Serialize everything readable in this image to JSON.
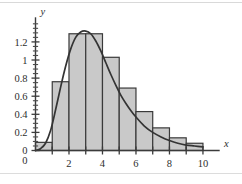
{
  "chart_data": {
    "type": "bar",
    "title": "",
    "subtitle": "",
    "xlabel": "x",
    "ylabel": "y",
    "xlim": [
      0,
      10.6
    ],
    "ylim": [
      0,
      1.42
    ],
    "grid": false,
    "legend": null,
    "bin_width": 1,
    "bin_edges": [
      0,
      1,
      2,
      3,
      4,
      5,
      6,
      7,
      8,
      9,
      10
    ],
    "categories": [
      "0-1",
      "1-2",
      "2-3",
      "3-4",
      "4-5",
      "5-6",
      "6-7",
      "7-8",
      "8-9",
      "9-10"
    ],
    "values": [
      0.09,
      0.76,
      1.29,
      1.29,
      1.03,
      0.69,
      0.43,
      0.25,
      0.14,
      0.08
    ],
    "xticks": [
      0,
      2,
      4,
      6,
      8,
      10
    ],
    "xtick_labels": [
      "0",
      "2",
      "4",
      "6",
      "8",
      "10"
    ],
    "yticks": [
      0,
      0.2,
      0.4,
      0.6,
      0.8,
      1,
      1.2
    ],
    "ytick_labels": [
      "0",
      "0.2",
      "0.4",
      "0.6",
      "0.8",
      "1",
      "1.2"
    ],
    "y_minor_tick_step": 0.05,
    "series": [
      {
        "name": "histogram",
        "type": "bar",
        "values": [
          0.09,
          0.76,
          1.29,
          1.29,
          1.03,
          0.69,
          0.43,
          0.25,
          0.14,
          0.08
        ]
      },
      {
        "name": "density-curve",
        "type": "line",
        "peak_x": 3.0,
        "peak_y": 1.32,
        "x": [
          0.3,
          0.6,
          0.9,
          1.2,
          1.5,
          1.8,
          2.1,
          2.4,
          2.7,
          3.0,
          3.3,
          3.6,
          3.9,
          4.2,
          4.5,
          4.8,
          5.1,
          5.4,
          5.7,
          6.0,
          6.5,
          7.0,
          7.5,
          8.0,
          8.5,
          9.0,
          9.5,
          10.0
        ],
        "y": [
          0.02,
          0.08,
          0.22,
          0.45,
          0.7,
          0.93,
          1.12,
          1.25,
          1.31,
          1.32,
          1.29,
          1.21,
          1.1,
          0.97,
          0.84,
          0.72,
          0.61,
          0.52,
          0.44,
          0.37,
          0.27,
          0.2,
          0.15,
          0.11,
          0.08,
          0.06,
          0.05,
          0.04
        ]
      }
    ]
  },
  "colors": {
    "bar_fill": "#c9c9c9",
    "bar_stroke": "#3a3a3a",
    "curve": "#343434",
    "axis": "#3b3b3b",
    "background": "#ffffff"
  }
}
